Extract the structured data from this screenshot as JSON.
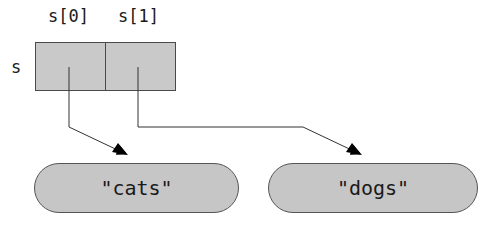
{
  "diagram": {
    "variable_name": "s",
    "array": {
      "index_labels": [
        "s[0]",
        "s[1]"
      ]
    },
    "strings": [
      {
        "value": "\"cats\""
      },
      {
        "value": "\"dogs\""
      }
    ],
    "pointers": [
      {
        "from": "s[0]",
        "to": "\"cats\""
      },
      {
        "from": "s[1]",
        "to": "\"dogs\""
      }
    ],
    "colors": {
      "fill": "#c9c9c9",
      "stroke": "#4a4a4a",
      "arrow": "#000000"
    }
  }
}
